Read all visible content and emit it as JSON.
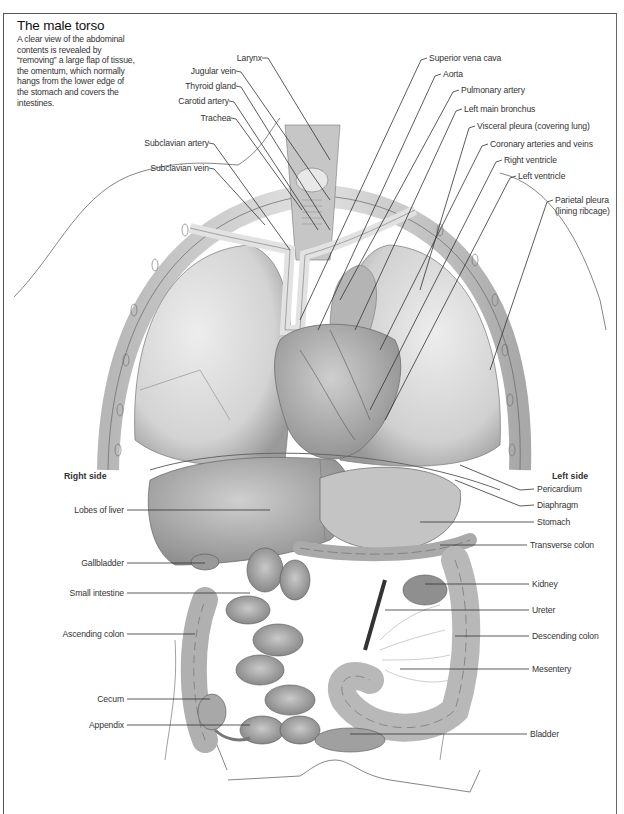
{
  "title": "The male torso",
  "caption": "A clear view of the abdominal contents is revealed by “removing” a large flap of tissue, the omentum, which normally hangs from the lower edge of the stomach and covers the intestines.",
  "sides": {
    "right": "Right side",
    "left": "Left side"
  },
  "labels_left_upper": [
    {
      "text": "Larynx",
      "x": 270,
      "y": 58
    },
    {
      "text": "Jugular vein",
      "x": 233,
      "y": 71
    },
    {
      "text": "Thyroid gland",
      "x": 233,
      "y": 86
    },
    {
      "text": "Carotid artery",
      "x": 226,
      "y": 101
    },
    {
      "text": "Trachea",
      "x": 228,
      "y": 118
    },
    {
      "text": "Subclavian artery",
      "x": 206,
      "y": 143
    },
    {
      "text": "Subclavian vein",
      "x": 206,
      "y": 168
    }
  ],
  "labels_right_upper": [
    {
      "text": "Superior vena cava",
      "x": 428,
      "y": 58
    },
    {
      "text": "Aorta",
      "x": 443,
      "y": 74
    },
    {
      "text": "Pulmonary artery",
      "x": 461,
      "y": 90
    },
    {
      "text": "Left main bronchus",
      "x": 464,
      "y": 109
    },
    {
      "text": "Visceral pleura (covering lung)",
      "x": 477,
      "y": 126
    },
    {
      "text": "Coronary arteries and veins",
      "x": 490,
      "y": 144
    },
    {
      "text": "Right ventricle",
      "x": 504,
      "y": 160
    },
    {
      "text": "Left ventricle",
      "x": 518,
      "y": 176
    },
    {
      "text": "Parietal pleura",
      "x": 555,
      "y": 200
    },
    {
      "text": "(lining ribcage)",
      "x": 555,
      "y": 211
    }
  ],
  "labels_left_lower": [
    {
      "text": "Lobes of liver",
      "x": 124,
      "y": 510
    },
    {
      "text": "Gallbladder",
      "x": 124,
      "y": 563
    },
    {
      "text": "Small intestine",
      "x": 124,
      "y": 593
    },
    {
      "text": "Ascending colon",
      "x": 124,
      "y": 634
    },
    {
      "text": "Cecum",
      "x": 124,
      "y": 699
    },
    {
      "text": "Appendix",
      "x": 124,
      "y": 725
    }
  ],
  "labels_right_lower": [
    {
      "text": "Pericardium",
      "x": 537,
      "y": 489
    },
    {
      "text": "Diaphragm",
      "x": 537,
      "y": 505
    },
    {
      "text": "Stomach",
      "x": 537,
      "y": 522
    },
    {
      "text": "Transverse colon",
      "x": 530,
      "y": 545
    },
    {
      "text": "Kidney",
      "x": 532,
      "y": 584
    },
    {
      "text": "Ureter",
      "x": 532,
      "y": 610
    },
    {
      "text": "Descending colon",
      "x": 532,
      "y": 636
    },
    {
      "text": "Mesentery",
      "x": 532,
      "y": 669
    },
    {
      "text": "Bladder",
      "x": 530,
      "y": 734
    }
  ]
}
